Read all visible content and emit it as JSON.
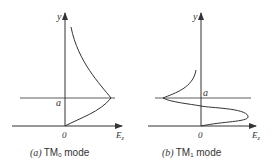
{
  "figure": {
    "panels": [
      {
        "id": "a",
        "caption_prefix": "(a)",
        "caption_mode_main": "TM",
        "caption_mode_sub": "0",
        "caption_suffix": " mode",
        "y_axis_label": "y",
        "x_axis_label_main": "E",
        "x_axis_label_sub": "z",
        "origin_label": "0",
        "boundary_label": "a"
      },
      {
        "id": "b",
        "caption_prefix": "(b)",
        "caption_mode_main": "TM",
        "caption_mode_sub": "1",
        "caption_suffix": " mode",
        "y_axis_label": "y",
        "x_axis_label_main": "E",
        "x_axis_label_sub": "z",
        "origin_label": "0",
        "boundary_label": "a"
      }
    ],
    "colors": {
      "line": "#333333",
      "background": "#ffffff"
    }
  }
}
